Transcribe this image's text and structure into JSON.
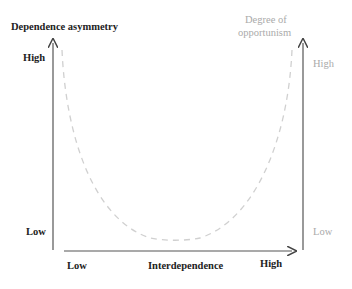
{
  "diagram": {
    "left_axis": {
      "title": "Dependence asymmetry",
      "high": "High",
      "low": "Low"
    },
    "right_axis": {
      "title_line1": "Degree of",
      "title_line2": "opportunism",
      "high": "High",
      "low": "Low"
    },
    "x_axis": {
      "title": "Interdependence",
      "low": "Low",
      "high": "High"
    },
    "curve": {
      "style": "dashed",
      "shape": "U",
      "color": "#d0d0d0"
    },
    "colors": {
      "axis": "#555555",
      "bold_text": "#222222",
      "grey_text": "#aaaaaa"
    }
  }
}
